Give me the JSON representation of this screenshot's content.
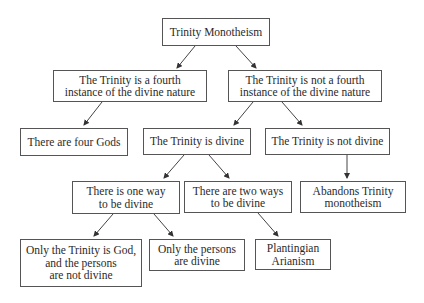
{
  "diagram": {
    "title": "Trinity Monotheism",
    "nodes": [
      {
        "id": "root",
        "label": "Trinity Monotheism"
      },
      {
        "id": "fourth",
        "label": "The Trinity is a fourth\ninstance of the divine nature"
      },
      {
        "id": "notfourth",
        "label": "The Trinity is not a fourth\ninstance of the divine nature"
      },
      {
        "id": "fourgods",
        "label": "There are four Gods"
      },
      {
        "id": "divine",
        "label": "The Trinity is divine"
      },
      {
        "id": "notdivine",
        "label": "The Trinity is not divine"
      },
      {
        "id": "oneway",
        "label": "There is one way\nto be divine"
      },
      {
        "id": "twoways",
        "label": "There are two ways\nto be divine"
      },
      {
        "id": "abandons",
        "label": "Abandons Trinity\nmonotheism"
      },
      {
        "id": "onlytrinity",
        "label": "Only the Trinity is God,\nand the persons\nare not divine"
      },
      {
        "id": "onlypersons",
        "label": "Only the persons\nare divine"
      },
      {
        "id": "plantingian",
        "label": "Plantingian\nArianism"
      }
    ],
    "edges": [
      [
        "root",
        "fourth"
      ],
      [
        "root",
        "notfourth"
      ],
      [
        "fourth",
        "fourgods"
      ],
      [
        "notfourth",
        "divine"
      ],
      [
        "notfourth",
        "notdivine"
      ],
      [
        "divine",
        "oneway"
      ],
      [
        "divine",
        "twoways"
      ],
      [
        "notdivine",
        "abandons"
      ],
      [
        "oneway",
        "onlytrinity"
      ],
      [
        "oneway",
        "onlypersons"
      ],
      [
        "twoways",
        "plantingian"
      ]
    ]
  }
}
